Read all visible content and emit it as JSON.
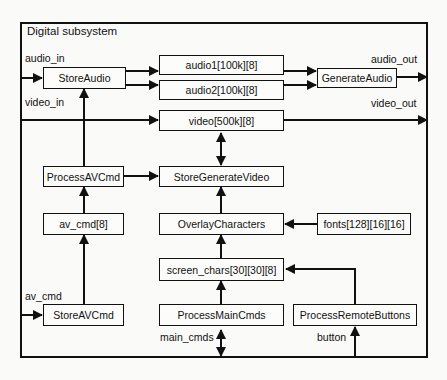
{
  "diagram": {
    "title": "Digital subsystem",
    "nodes": {
      "store_audio": "StoreAudio",
      "audio1": "audio1[100k][8]",
      "audio2": "audio2[100k][8]",
      "generate_audio": "GenerateAudio",
      "video": "video[500k][8]",
      "process_av_cmd": "ProcessAVCmd",
      "store_generate_video": "StoreGenerateVideo",
      "av_cmd_buffer": "av_cmd[8]",
      "overlay_characters": "OverlayCharacters",
      "fonts": "fonts[128][16][16]",
      "screen_chars": "screen_chars[30][30][8]",
      "store_av_cmd": "StoreAVCmd",
      "process_main_cmds": "ProcessMainCmds",
      "process_remote_buttons": "ProcessRemoteButtons"
    },
    "signals": {
      "audio_in": "audio_in",
      "audio_out": "audio_out",
      "video_in": "video_in",
      "video_out": "video_out",
      "av_cmd": "av_cmd",
      "main_cmds": "main_cmds",
      "button": "button"
    },
    "edges": [
      {
        "from": "audio_in",
        "to": "StoreAudio"
      },
      {
        "from": "StoreAudio",
        "to": "audio1[100k][8]"
      },
      {
        "from": "StoreAudio",
        "to": "audio2[100k][8]"
      },
      {
        "from": "audio1[100k][8]",
        "to": "GenerateAudio"
      },
      {
        "from": "audio2[100k][8]",
        "to": "GenerateAudio"
      },
      {
        "from": "GenerateAudio",
        "to": "audio_out"
      },
      {
        "from": "video_in",
        "to": "video[500k][8]"
      },
      {
        "from": "video[500k][8]",
        "to": "video_out"
      },
      {
        "from": "ProcessAVCmd",
        "to": "StoreAudio"
      },
      {
        "from": "ProcessAVCmd",
        "to": "StoreGenerateVideo"
      },
      {
        "from": "StoreGenerateVideo",
        "to": "video[500k][8]",
        "bidirectional": true
      },
      {
        "from": "av_cmd[8]",
        "to": "ProcessAVCmd"
      },
      {
        "from": "OverlayCharacters",
        "to": "StoreGenerateVideo"
      },
      {
        "from": "fonts[128][16][16]",
        "to": "OverlayCharacters"
      },
      {
        "from": "screen_chars[30][30][8]",
        "to": "OverlayCharacters"
      },
      {
        "from": "StoreAVCmd",
        "to": "av_cmd[8]"
      },
      {
        "from": "av_cmd",
        "to": "StoreAVCmd"
      },
      {
        "from": "ProcessMainCmds",
        "to": "screen_chars[30][30][8]"
      },
      {
        "from": "main_cmds",
        "to": "ProcessMainCmds",
        "bidirectional": true
      },
      {
        "from": "ProcessRemoteButtons",
        "to": "screen_chars[30][30][8]"
      },
      {
        "from": "button",
        "to": "ProcessRemoteButtons"
      }
    ]
  }
}
